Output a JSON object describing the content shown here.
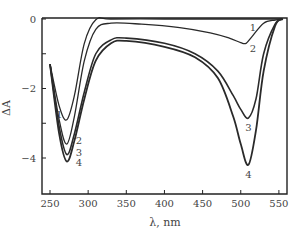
{
  "chart_data": {
    "type": "line",
    "title": "",
    "xlabel": "λ, nm",
    "ylabel": "ΔA",
    "xlim": [
      240,
      560
    ],
    "ylim": [
      -5.1,
      0
    ],
    "x_ticks": [
      250,
      300,
      350,
      400,
      450,
      500,
      550
    ],
    "y_ticks": [
      0,
      -2,
      -4
    ],
    "y_minor_ticks": [
      -1,
      -3
    ],
    "grid": false,
    "legend": "inline numeric labels 1-4 next to curves",
    "series": [
      {
        "name": "1",
        "x": [
          250,
          262,
          272,
          282,
          295,
          310,
          330,
          400,
          450,
          480,
          495,
          505,
          515,
          530,
          545,
          555
        ],
        "y": [
          -1.3,
          -2.5,
          -2.9,
          -2.2,
          -0.7,
          -0.02,
          0,
          0,
          0,
          0,
          0,
          0,
          0,
          0,
          0,
          0
        ]
      },
      {
        "name": "2",
        "x": [
          250,
          262,
          272,
          282,
          295,
          310,
          330,
          370,
          420,
          460,
          485,
          500,
          507,
          515,
          530,
          545,
          555
        ],
        "y": [
          -1.3,
          -2.9,
          -3.6,
          -2.8,
          -1.2,
          -0.3,
          -0.12,
          -0.15,
          -0.25,
          -0.4,
          -0.55,
          -0.68,
          -0.7,
          -0.5,
          -0.12,
          -0.03,
          0
        ]
      },
      {
        "name": "3",
        "x": [
          250,
          262,
          272,
          282,
          295,
          310,
          330,
          350,
          400,
          440,
          470,
          490,
          500,
          510,
          520,
          530,
          545,
          555
        ],
        "y": [
          -1.3,
          -3.1,
          -3.9,
          -3.3,
          -2.1,
          -1.0,
          -0.6,
          -0.55,
          -0.7,
          -1.0,
          -1.5,
          -2.2,
          -2.6,
          -2.85,
          -2.3,
          -1.0,
          -0.15,
          0
        ]
      },
      {
        "name": "4",
        "x": [
          250,
          262,
          272,
          282,
          295,
          310,
          330,
          350,
          400,
          440,
          470,
          490,
          500,
          510,
          520,
          530,
          545,
          555
        ],
        "y": [
          -1.3,
          -3.3,
          -4.1,
          -3.5,
          -2.3,
          -1.2,
          -0.7,
          -0.63,
          -0.8,
          -1.1,
          -1.7,
          -2.8,
          -3.6,
          -4.2,
          -3.2,
          -1.5,
          -0.2,
          0
        ]
      }
    ],
    "annotations": [
      {
        "text": "1",
        "x": 262,
        "y": -2.75
      },
      {
        "text": "2",
        "x": 288,
        "y": -3.5
      },
      {
        "text": "3",
        "x": 288,
        "y": -3.85
      },
      {
        "text": "4",
        "x": 288,
        "y": -4.15
      },
      {
        "text": "1",
        "x": 516,
        "y": -0.25
      },
      {
        "text": "2",
        "x": 516,
        "y": -0.85
      },
      {
        "text": "3",
        "x": 510,
        "y": -3.15
      },
      {
        "text": "4",
        "x": 510,
        "y": -4.5
      }
    ]
  },
  "labels": {
    "xlabel": "λ, nm",
    "ylabel": "ΔA"
  }
}
